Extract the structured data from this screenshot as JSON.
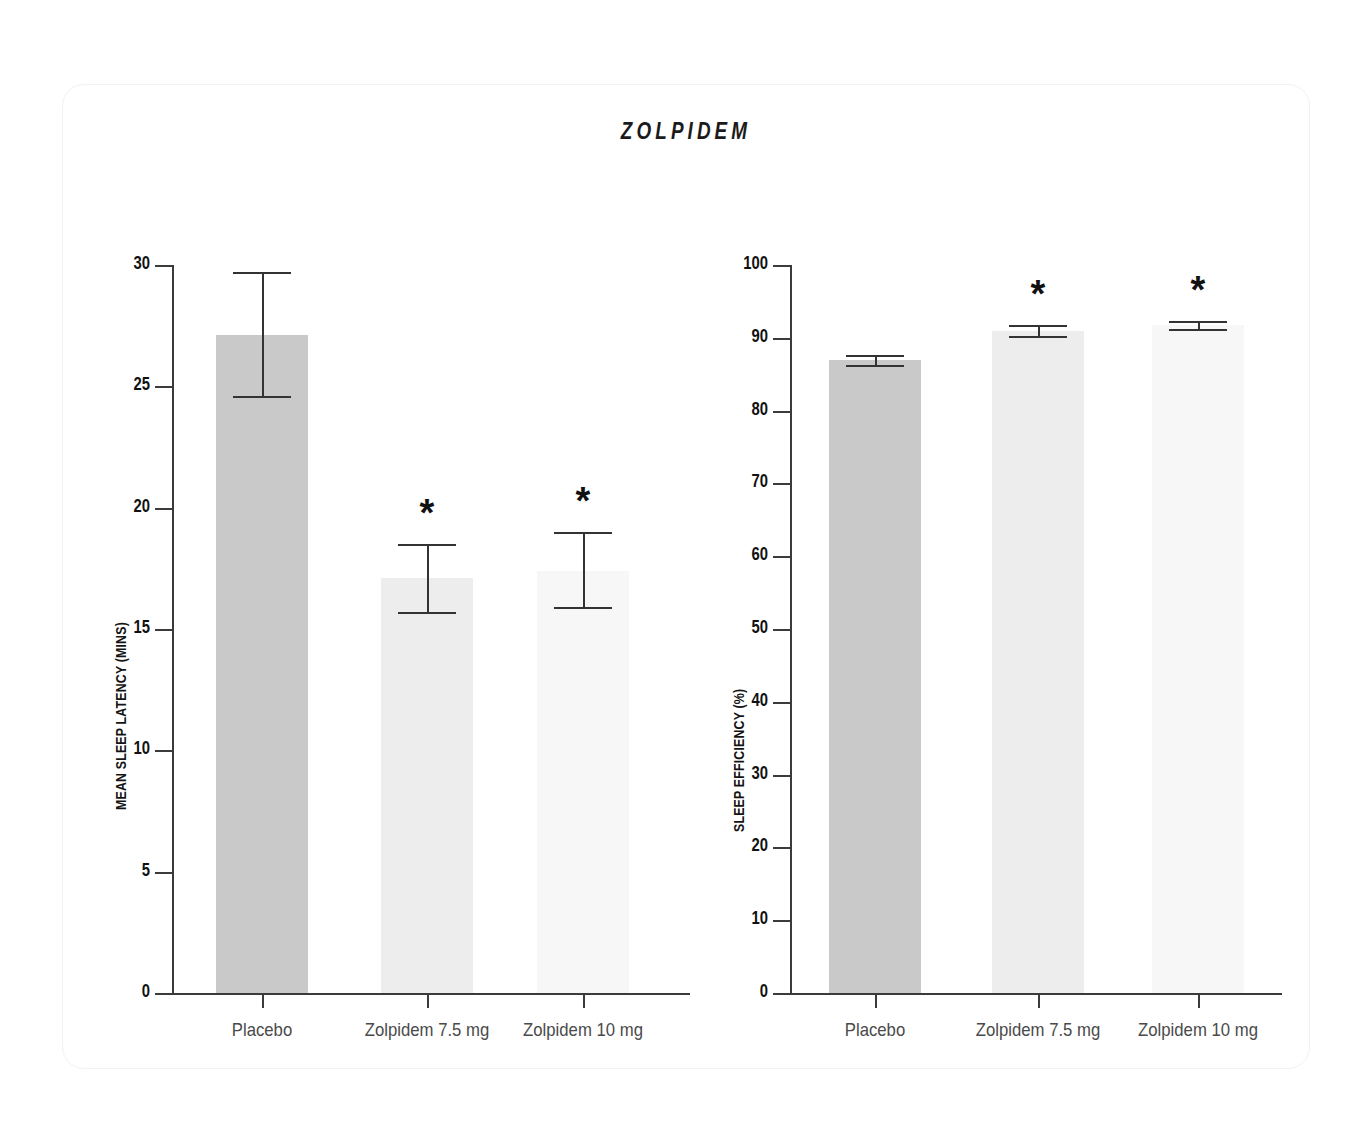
{
  "figure": {
    "title": "ZOLPIDEM",
    "background": "#ffffff",
    "card_border": "#f2f2f2"
  },
  "colors": {
    "bar_placebo": "#c9c9c9",
    "bar_dose_low": "#ededed",
    "bar_dose_high": "#f7f7f7",
    "axis": "#3b3b3b",
    "error_bar": "#333333",
    "tick_text": "#111111",
    "category_text": "#4a4a4a"
  },
  "chart_data": [
    {
      "id": "sleep-latency",
      "type": "bar",
      "title": "ZOLPIDEM",
      "xlabel": "",
      "ylabel": "MEAN SLEEP LATENCY (MINS)",
      "categories": [
        "Placebo",
        "Zolpidem 7.5 mg",
        "Zolpidem 10 mg"
      ],
      "values": [
        27.1,
        17.1,
        17.4
      ],
      "errors_low": [
        24.6,
        15.7,
        15.9
      ],
      "errors_high": [
        29.7,
        18.5,
        19.0
      ],
      "significance": [
        "",
        "*",
        "*"
      ],
      "ylim": [
        0,
        30
      ],
      "yticks": [
        0,
        5,
        10,
        15,
        20,
        25,
        30
      ],
      "ytick_labels": [
        "0",
        "5",
        "10",
        "15",
        "20",
        "25",
        "30"
      ],
      "grid": false,
      "legend": "none"
    },
    {
      "id": "sleep-efficiency",
      "type": "bar",
      "title": "ZOLPIDEM",
      "xlabel": "",
      "ylabel": "SLEEP EFFICIENCY (%)",
      "categories": [
        "Placebo",
        "Zolpidem 7.5 mg",
        "Zolpidem 10 mg"
      ],
      "values": [
        87.0,
        91.0,
        91.7
      ],
      "errors_low": [
        86.3,
        90.3,
        91.2
      ],
      "errors_high": [
        87.7,
        91.8,
        92.3
      ],
      "significance": [
        "",
        "*",
        "*"
      ],
      "ylim": [
        0,
        100
      ],
      "yticks": [
        0,
        10,
        20,
        30,
        40,
        50,
        60,
        70,
        80,
        90,
        100
      ],
      "ytick_labels": [
        "0",
        "10",
        "20",
        "30",
        "40",
        "50",
        "60",
        "70",
        "80",
        "90",
        "100"
      ],
      "grid": false,
      "legend": "none"
    }
  ]
}
